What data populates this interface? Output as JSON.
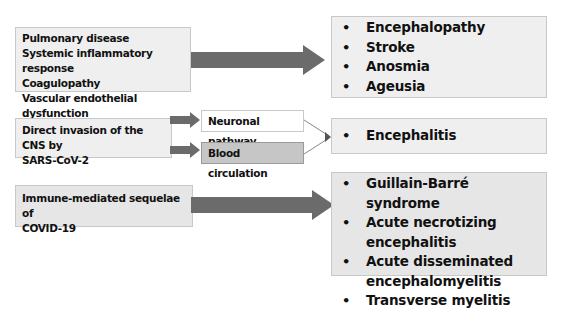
{
  "colors": {
    "box_fill": "#efefef",
    "box_border": "#c8c8c8",
    "arrow": "#6b6b6b",
    "blood_box_fill": "#c6c6c6",
    "neuronal_box_fill": "#ffffff",
    "connector_line": "#888888",
    "text": "#111111"
  },
  "rows": [
    {
      "cause": {
        "lines": [
          "Pulmonary disease",
          "Systemic inflammatory response",
          "Coagulopathy",
          "Vascular endothelial dysfunction"
        ]
      },
      "effects": [
        "Encephalopathy",
        "Stroke",
        "Anosmia",
        "Ageusia"
      ]
    },
    {
      "cause": {
        "lines": [
          "Direct invasion of the CNS by",
          "SARS-CoV-2"
        ]
      },
      "pathways": [
        "Neuronal pathway",
        "Blood circulation"
      ],
      "effects": [
        "Encephalitis"
      ]
    },
    {
      "cause": {
        "lines": [
          "Immune-mediated sequelae of",
          "COVID-19"
        ]
      },
      "effects": [
        "Guillain-Barré syndrome",
        "Acute necrotizing encephalitis",
        "Acute disseminated encephalomyelitis",
        "Transverse myelitis"
      ]
    }
  ],
  "icons": {
    "arrow": "right-arrow-icon",
    "bullet": "bullet-icon"
  }
}
